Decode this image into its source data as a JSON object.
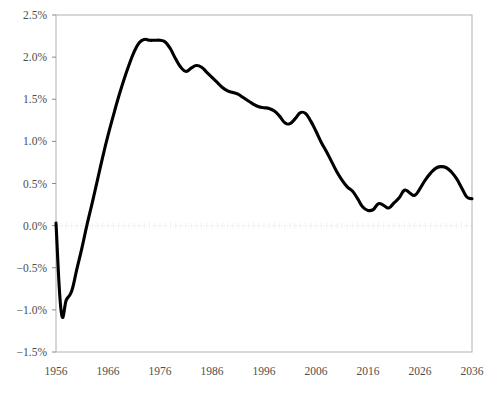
{
  "chart_data": {
    "type": "line",
    "title": "",
    "subtitle": "",
    "xlabel": "",
    "ylabel": "",
    "xlim": [
      1956,
      2036
    ],
    "ylim": [
      -1.5,
      2.5
    ],
    "grid": false,
    "legend_position": "none",
    "y_tick_labels": [
      "2.5%",
      "2.0%",
      "1.5%",
      "1.0%",
      "0.5%",
      "0.0%",
      "-0.5%",
      "-1.0%",
      "-1.5%"
    ],
    "y_tick_values": [
      2.5,
      2.0,
      1.5,
      1.0,
      0.5,
      0.0,
      -0.5,
      -1.0,
      -1.5
    ],
    "x_tick_labels": [
      "1956",
      "1966",
      "1976",
      "1986",
      "1996",
      "2006",
      "2016",
      "2026",
      "2036"
    ],
    "x_tick_values": [
      1956,
      1966,
      1976,
      1986,
      1996,
      2006,
      2016,
      2026,
      2036
    ],
    "zero_reference_line": 0.0,
    "series": [
      {
        "name": "annual growth rate",
        "color": "#000000",
        "x": [
          1956,
          1957,
          1958,
          1959,
          1960,
          1961,
          1962,
          1963,
          1964,
          1965,
          1966,
          1967,
          1968,
          1969,
          1970,
          1971,
          1972,
          1973,
          1974,
          1975,
          1976,
          1977,
          1978,
          1979,
          1980,
          1981,
          1982,
          1983,
          1984,
          1985,
          1986,
          1987,
          1988,
          1989,
          1990,
          1991,
          1992,
          1993,
          1994,
          1995,
          1996,
          1997,
          1998,
          1999,
          2000,
          2001,
          2002,
          2003,
          2004,
          2005,
          2006,
          2007,
          2008,
          2009,
          2010,
          2011,
          2012,
          2013,
          2014,
          2015,
          2016,
          2017,
          2018,
          2019,
          2020,
          2021,
          2022,
          2023,
          2024,
          2025,
          2026,
          2027,
          2028,
          2029,
          2030,
          2031,
          2032,
          2033,
          2034,
          2035,
          2036
        ],
        "values": [
          0.03,
          -1.02,
          -0.88,
          -0.78,
          -0.52,
          -0.26,
          0.02,
          0.28,
          0.55,
          0.82,
          1.07,
          1.3,
          1.52,
          1.72,
          1.9,
          2.06,
          2.17,
          2.21,
          2.2,
          2.2,
          2.2,
          2.18,
          2.1,
          1.98,
          1.88,
          1.83,
          1.87,
          1.9,
          1.88,
          1.82,
          1.76,
          1.7,
          1.64,
          1.6,
          1.58,
          1.56,
          1.52,
          1.48,
          1.44,
          1.41,
          1.4,
          1.39,
          1.36,
          1.3,
          1.22,
          1.21,
          1.27,
          1.34,
          1.33,
          1.24,
          1.12,
          0.99,
          0.88,
          0.76,
          0.64,
          0.54,
          0.46,
          0.41,
          0.32,
          0.22,
          0.18,
          0.19,
          0.26,
          0.24,
          0.21,
          0.27,
          0.33,
          0.42,
          0.39,
          0.36,
          0.44,
          0.54,
          0.62,
          0.68,
          0.7,
          0.69,
          0.64,
          0.56,
          0.45,
          0.34,
          0.32
        ]
      }
    ]
  },
  "axes": {
    "y_axis_name": "y-axis",
    "x_axis_name": "x-axis"
  }
}
